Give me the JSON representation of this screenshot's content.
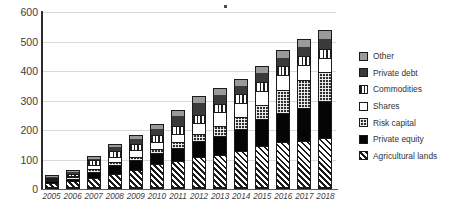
{
  "chart_data": {
    "type": "bar",
    "stacked": true,
    "title": "",
    "subtitle": "",
    "xlabel": "",
    "ylabel": "",
    "ylim": [
      0,
      600
    ],
    "ytick_values": [
      0,
      100,
      200,
      300,
      400,
      500,
      600
    ],
    "ytick_labels": [
      "0",
      "100",
      "200",
      "300",
      "400",
      "500",
      "600"
    ],
    "grid": true,
    "legend_position": "right",
    "categories": [
      "2005",
      "2006",
      "2007",
      "2008",
      "2009",
      "2010",
      "2011",
      "2012",
      "2013",
      "2014",
      "2015",
      "2016",
      "2017",
      "2018"
    ],
    "series": [
      {
        "name": "Agricultural lands",
        "pattern": "diagonal-hatch",
        "color": "#ffffff",
        "values": [
          18,
          23,
          34,
          48,
          61,
          80,
          91,
          103,
          112,
          124,
          141,
          154,
          159,
          168
        ]
      },
      {
        "name": "Private equity",
        "pattern": "solid-black",
        "color": "#050505",
        "values": [
          6,
          9,
          22,
          30,
          34,
          38,
          45,
          58,
          66,
          76,
          92,
          102,
          113,
          126
        ]
      },
      {
        "name": "Risk capital",
        "pattern": "checker-dots",
        "color": "#2e2e2e",
        "values": [
          4,
          5,
          8,
          10,
          12,
          15,
          20,
          21,
          33,
          42,
          50,
          79,
          97,
          100
        ]
      },
      {
        "name": "Shares",
        "pattern": "solid-white",
        "color": "#ffffff",
        "values": [
          3,
          4,
          14,
          20,
          22,
          25,
          28,
          39,
          48,
          49,
          48,
          50,
          51,
          49
        ]
      },
      {
        "name": "Commodities",
        "pattern": "vertical-stripes",
        "color": "#ffffff",
        "values": [
          5,
          7,
          18,
          21,
          22,
          25,
          29,
          29,
          29,
          29,
          31,
          30,
          29,
          30
        ]
      },
      {
        "name": "Private debt",
        "pattern": "solid-dark-gray",
        "color": "#3a3a3a",
        "values": [
          8,
          12,
          10,
          17,
          22,
          24,
          36,
          44,
          35,
          32,
          35,
          33,
          35,
          40
        ]
      },
      {
        "name": "Other",
        "pattern": "solid-light-gray",
        "color": "#9a9a9a",
        "values": [
          3,
          5,
          5,
          8,
          11,
          14,
          19,
          20,
          21,
          21,
          21,
          22,
          25,
          27
        ]
      }
    ],
    "totals": [
      47,
      65,
      111,
      154,
      184,
      221,
      268,
      314,
      344,
      373,
      418,
      470,
      509,
      540
    ]
  },
  "legend": {
    "items": [
      {
        "label": "Other",
        "swatch": "other-swatch"
      },
      {
        "label": "Private debt",
        "swatch": "private-debt-swatch"
      },
      {
        "label": "Commodities",
        "swatch": "commodities-swatch"
      },
      {
        "label": "Shares",
        "swatch": "shares-swatch"
      },
      {
        "label": "Risk capital",
        "swatch": "risk-capital-swatch"
      },
      {
        "label": "Private equity",
        "swatch": "private-equity-swatch"
      },
      {
        "label": "Agricultural lands",
        "swatch": "agricultural-lands-swatch"
      }
    ]
  }
}
